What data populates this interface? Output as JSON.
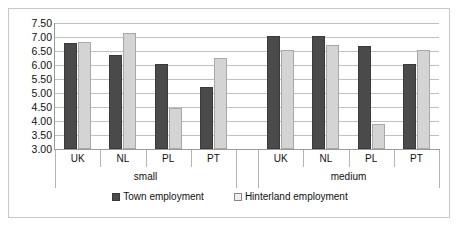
{
  "chart_data": {
    "type": "bar",
    "title": "",
    "subtitle": "",
    "xlabel": "",
    "ylabel": "",
    "ylim": [
      3.0,
      7.5
    ],
    "ytick_step": 0.5,
    "ytick_labels": [
      "7.50",
      "7.00",
      "6.50",
      "6.00",
      "5.50",
      "5.00",
      "4.50",
      "4.00",
      "3.50",
      "3.00"
    ],
    "ytick_values": [
      7.5,
      7.0,
      6.5,
      6.0,
      5.5,
      5.0,
      4.5,
      4.0,
      3.5,
      3.0
    ],
    "grid": true,
    "legend_position": "bottom",
    "group_labels": [
      "small",
      "medium"
    ],
    "categories": [
      "UK",
      "NL",
      "PL",
      "PT",
      "UK",
      "NL",
      "PL",
      "PT"
    ],
    "series": [
      {
        "name": "Town employment",
        "color": "#4a4a4a",
        "values": [
          6.78,
          6.37,
          6.03,
          5.22,
          7.05,
          7.02,
          6.68,
          6.02
        ]
      },
      {
        "name": "Hinterland employment",
        "color": "#d4d4d4",
        "values": [
          6.82,
          7.15,
          4.45,
          6.25,
          6.55,
          6.72,
          3.88,
          6.55
        ]
      }
    ],
    "groups": [
      {
        "label": "small",
        "categories": [
          "UK",
          "NL",
          "PL",
          "PT"
        ],
        "town_employment": [
          6.78,
          6.37,
          6.03,
          5.22
        ],
        "hinterland_employment": [
          6.82,
          7.15,
          4.45,
          6.25
        ]
      },
      {
        "label": "medium",
        "categories": [
          "UK",
          "NL",
          "PL",
          "PT"
        ],
        "town_employment": [
          7.05,
          7.02,
          6.68,
          6.02
        ],
        "hinterland_employment": [
          6.55,
          6.72,
          3.88,
          6.55
        ]
      }
    ]
  },
  "legend": {
    "entries": [
      {
        "label": "Town employment",
        "swatch": "town"
      },
      {
        "label": "Hinterland employment",
        "swatch": "hinterland"
      }
    ]
  },
  "colors": {
    "town": "#4a4a4a",
    "hinterland": "#d4d4d4",
    "gridline": "#c0c0c0",
    "axis": "#9a9a9a",
    "frame_border": "#c8c8c8",
    "background": "#ffffff",
    "text": "#101010"
  }
}
